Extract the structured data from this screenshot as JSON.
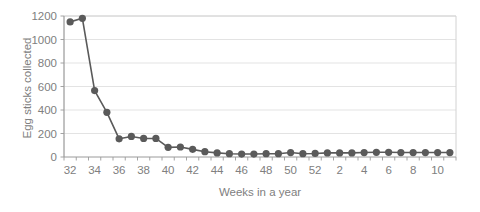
{
  "chart_data": {
    "type": "line",
    "title": "",
    "xlabel": "Weeks in a year",
    "ylabel": "Egg sticks collected",
    "grid": true,
    "legend": false,
    "marker": "circle",
    "line_color": "#5a5a5a",
    "marker_color": "#5a5a5a",
    "gridline_color": "#dcdcdc",
    "text_color": "#808080",
    "xlim": [
      31.5,
      42.5
    ],
    "ylim": [
      0,
      1200
    ],
    "yticks": [
      0,
      200,
      400,
      600,
      800,
      1000,
      1200
    ],
    "ytick_labels": [
      "0",
      "200",
      "400",
      "600",
      "800",
      "1000",
      "1200"
    ],
    "xtick_labels": [
      "32",
      "34",
      "36",
      "38",
      "40",
      "42",
      "44",
      "46",
      "48",
      "50",
      "52",
      "2",
      "4",
      "6",
      "8",
      "10"
    ],
    "x_categories": [
      "32",
      "33",
      "34",
      "35",
      "36",
      "37",
      "38",
      "39",
      "40",
      "41",
      "42",
      "43",
      "44",
      "45",
      "46",
      "47",
      "48",
      "49",
      "50",
      "51",
      "52",
      "1",
      "2",
      "3",
      "4",
      "5",
      "6",
      "7",
      "8",
      "9",
      "10",
      "11"
    ],
    "categories": [
      "32",
      "33",
      "34",
      "35",
      "36",
      "37",
      "38",
      "39",
      "40",
      "41",
      "42",
      "43",
      "44",
      "45",
      "46",
      "47",
      "48",
      "49",
      "50",
      "51",
      "52",
      "1",
      "2",
      "3",
      "4",
      "5",
      "6",
      "7",
      "8",
      "9",
      "10",
      "11"
    ],
    "values": [
      1150,
      1180,
      565,
      380,
      155,
      175,
      158,
      158,
      82,
      85,
      65,
      45,
      35,
      28,
      25,
      25,
      28,
      28,
      38,
      28,
      30,
      35,
      35,
      35,
      38,
      40,
      40,
      38,
      38,
      38,
      38,
      38
    ]
  }
}
